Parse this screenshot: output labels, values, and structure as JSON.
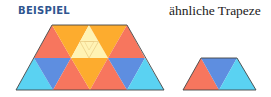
{
  "header": {
    "example_label": "BEISPIEL",
    "title": "ähnliche Trapeze"
  },
  "colors": {
    "red": "#f7765e",
    "orange": "#fdac2e",
    "light_yellow": "#fff3b4",
    "blue": "#5e8ee0",
    "cyan": "#5ad2f2",
    "outline": "#444444",
    "label_blue": "#2f5590"
  },
  "figures": [
    {
      "name": "large-trapezoid",
      "rows": [
        [
          "red",
          "orange",
          "light_yellow (subdivided into 4)",
          "orange",
          "red"
        ],
        [
          "cyan",
          "blue",
          "red",
          "orange",
          "red",
          "blue",
          "cyan"
        ]
      ]
    },
    {
      "name": "small-trapezoid",
      "rows": [
        [
          "red",
          "blue",
          "cyan"
        ]
      ]
    }
  ]
}
